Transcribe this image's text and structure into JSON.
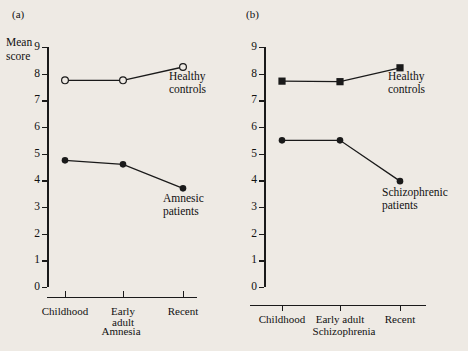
{
  "figure": {
    "background_color": "#eeeae4",
    "ink_color": "#1a1a1a"
  },
  "panels": [
    {
      "letter": "(a)",
      "y_axis_label_line1": "Mean",
      "y_axis_label_line2": "score",
      "x_axis_title": "Amnesia",
      "series_label_upper_line1": "Healthy",
      "series_label_upper_line2": "controls",
      "series_label_lower_line1": "Amnesic",
      "series_label_lower_line2": "patients"
    },
    {
      "letter": "(b)",
      "y_axis_label": "Autobiographical score",
      "x_axis_title": "Schizophrenia",
      "series_label_upper_line1": "Healthy",
      "series_label_upper_line2": "controls",
      "series_label_lower_line1": "Schizophrenic",
      "series_label_lower_line2": "patients"
    }
  ],
  "chart_data": [
    {
      "type": "line",
      "panel": "(a)",
      "title": "Amnesia",
      "xlabel": "Amnesia",
      "ylabel": "Mean score",
      "categories": [
        "Childhood",
        "Early adult",
        "Recent"
      ],
      "tick_labels": [
        "Childhood",
        "Early\nadult",
        "Recent"
      ],
      "ylim": [
        0,
        9
      ],
      "yticks": [
        0,
        1,
        2,
        3,
        4,
        5,
        6,
        7,
        8,
        9
      ],
      "grid": false,
      "legend": "inline-annotations",
      "series": [
        {
          "name": "Healthy controls",
          "marker": "open-circle",
          "values": [
            7.75,
            7.75,
            8.25
          ]
        },
        {
          "name": "Amnesic patients",
          "marker": "filled-circle",
          "values": [
            4.75,
            4.6,
            3.7
          ]
        }
      ]
    },
    {
      "type": "line",
      "panel": "(b)",
      "title": "Schizophrenia",
      "xlabel": "Schizophrenia",
      "ylabel": "Autobiographical score",
      "categories": [
        "Childhood",
        "Early adult",
        "Recent"
      ],
      "tick_labels": [
        "Childhood",
        "Early adult",
        "Recent"
      ],
      "ylim": [
        0,
        9
      ],
      "yticks": [
        0,
        1,
        2,
        3,
        4,
        5,
        6,
        7,
        8,
        9
      ],
      "grid": false,
      "legend": "inline-annotations",
      "series": [
        {
          "name": "Healthy controls",
          "marker": "filled-square",
          "values": [
            7.72,
            7.7,
            8.22
          ]
        },
        {
          "name": "Schizophrenic patients",
          "marker": "filled-circle",
          "values": [
            5.5,
            5.5,
            3.97
          ]
        }
      ]
    }
  ]
}
